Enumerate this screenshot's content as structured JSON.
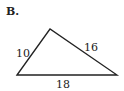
{
  "figure": {
    "label": "B.",
    "shape": "triangle",
    "sides": [
      {
        "name": "left",
        "length": "10"
      },
      {
        "name": "right",
        "length": "16"
      },
      {
        "name": "bottom",
        "length": "18"
      }
    ],
    "stroke_color": "#222222"
  }
}
